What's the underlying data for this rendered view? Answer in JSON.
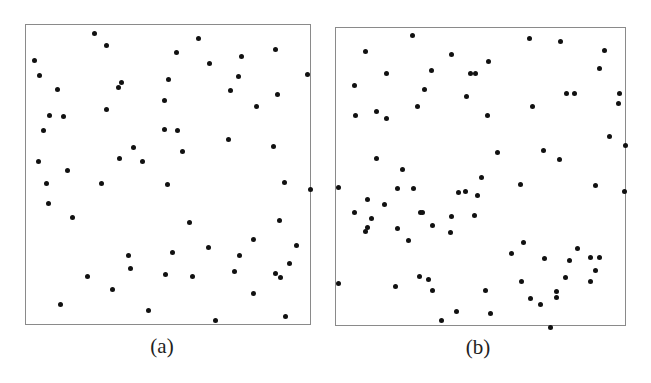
{
  "figure": {
    "panels": [
      {
        "id": "a",
        "caption": "(a)"
      },
      {
        "id": "b",
        "caption": "(b)"
      }
    ]
  },
  "chart_data": [
    {
      "type": "scatter",
      "title": "(a)",
      "xlabel": "",
      "ylabel": "",
      "grid": false,
      "legend": false,
      "description": "Point pattern, roughly uniform random distribution",
      "frame_px": {
        "left": 25,
        "top": 24,
        "width": 286,
        "height": 301
      },
      "point_color": "#111111",
      "points_px": [
        [
          33,
          59
        ],
        [
          38,
          74
        ],
        [
          56,
          88
        ],
        [
          48,
          114
        ],
        [
          62,
          115
        ],
        [
          42,
          129
        ],
        [
          93,
          32
        ],
        [
          105,
          44
        ],
        [
          120,
          81
        ],
        [
          117,
          86
        ],
        [
          105,
          108
        ],
        [
          197,
          37
        ],
        [
          175,
          51
        ],
        [
          240,
          55
        ],
        [
          274,
          48
        ],
        [
          208,
          62
        ],
        [
          237,
          75
        ],
        [
          306,
          73
        ],
        [
          167,
          78
        ],
        [
          229,
          89
        ],
        [
          276,
          93
        ],
        [
          255,
          105
        ],
        [
          163,
          99
        ],
        [
          176,
          129
        ],
        [
          163,
          128
        ],
        [
          227,
          138
        ],
        [
          272,
          145
        ],
        [
          181,
          150
        ],
        [
          37,
          160
        ],
        [
          66,
          169
        ],
        [
          45,
          182
        ],
        [
          100,
          182
        ],
        [
          47,
          202
        ],
        [
          71,
          216
        ],
        [
          127,
          254
        ],
        [
          129,
          267
        ],
        [
          86,
          275
        ],
        [
          111,
          288
        ],
        [
          59,
          303
        ],
        [
          147,
          309
        ],
        [
          118,
          157
        ],
        [
          132,
          146
        ],
        [
          141,
          160
        ],
        [
          166,
          183
        ],
        [
          283,
          181
        ],
        [
          309,
          188
        ],
        [
          188,
          221
        ],
        [
          278,
          219
        ],
        [
          252,
          238
        ],
        [
          295,
          244
        ],
        [
          171,
          251
        ],
        [
          207,
          246
        ],
        [
          238,
          254
        ],
        [
          288,
          262
        ],
        [
          164,
          273
        ],
        [
          191,
          275
        ],
        [
          233,
          270
        ],
        [
          274,
          272
        ],
        [
          279,
          276
        ],
        [
          252,
          292
        ],
        [
          214,
          319
        ],
        [
          284,
          315
        ]
      ]
    },
    {
      "type": "scatter",
      "title": "(b)",
      "xlabel": "",
      "ylabel": "",
      "grid": false,
      "legend": false,
      "description": "Point pattern, clustered distribution",
      "frame_px": {
        "left": 335,
        "top": 27,
        "width": 291,
        "height": 299
      },
      "point_color": "#111111",
      "points_px": [
        [
          411,
          34
        ],
        [
          364,
          50
        ],
        [
          450,
          53
        ],
        [
          385,
          72
        ],
        [
          430,
          69
        ],
        [
          469,
          72
        ],
        [
          474,
          72
        ],
        [
          487,
          60
        ],
        [
          353,
          84
        ],
        [
          423,
          88
        ],
        [
          465,
          95
        ],
        [
          416,
          105
        ],
        [
          354,
          114
        ],
        [
          375,
          110
        ],
        [
          385,
          117
        ],
        [
          486,
          114
        ],
        [
          375,
          157
        ],
        [
          401,
          168
        ],
        [
          528,
          37
        ],
        [
          559,
          40
        ],
        [
          603,
          49
        ],
        [
          598,
          67
        ],
        [
          565,
          92
        ],
        [
          573,
          92
        ],
        [
          618,
          92
        ],
        [
          617,
          102
        ],
        [
          531,
          105
        ],
        [
          608,
          135
        ],
        [
          624,
          144
        ],
        [
          496,
          151
        ],
        [
          542,
          149
        ],
        [
          558,
          158
        ],
        [
          519,
          183
        ],
        [
          594,
          184
        ],
        [
          623,
          190
        ],
        [
          337,
          186
        ],
        [
          366,
          198
        ],
        [
          353,
          211
        ],
        [
          370,
          217
        ],
        [
          366,
          226
        ],
        [
          364,
          230
        ],
        [
          383,
          203
        ],
        [
          396,
          187
        ],
        [
          412,
          187
        ],
        [
          419,
          211
        ],
        [
          421,
          211
        ],
        [
          396,
          227
        ],
        [
          431,
          224
        ],
        [
          407,
          239
        ],
        [
          480,
          176
        ],
        [
          457,
          191
        ],
        [
          464,
          190
        ],
        [
          476,
          194
        ],
        [
          450,
          215
        ],
        [
          473,
          214
        ],
        [
          449,
          231
        ],
        [
          522,
          241
        ],
        [
          510,
          252
        ],
        [
          543,
          257
        ],
        [
          576,
          247
        ],
        [
          568,
          259
        ],
        [
          589,
          256
        ],
        [
          598,
          256
        ],
        [
          594,
          269
        ],
        [
          564,
          276
        ],
        [
          589,
          280
        ],
        [
          520,
          280
        ],
        [
          555,
          290
        ],
        [
          555,
          296
        ],
        [
          529,
          297
        ],
        [
          539,
          303
        ],
        [
          549,
          326
        ],
        [
          337,
          282
        ],
        [
          394,
          285
        ],
        [
          418,
          275
        ],
        [
          427,
          278
        ],
        [
          431,
          289
        ],
        [
          484,
          289
        ],
        [
          455,
          310
        ],
        [
          440,
          319
        ],
        [
          489,
          312
        ]
      ]
    }
  ],
  "layout": {
    "captions_px": [
      {
        "x": 162,
        "y": 334
      },
      {
        "x": 478,
        "y": 335
      }
    ]
  }
}
